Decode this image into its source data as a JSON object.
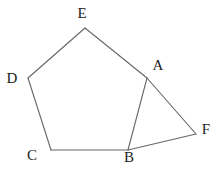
{
  "diagram": {
    "type": "geometry-figure",
    "stroke_color": "#666666",
    "points": {
      "A": {
        "x": 147,
        "y": 78,
        "label": "A",
        "lx": 158,
        "ly": 67
      },
      "B": {
        "x": 128,
        "y": 150,
        "label": "B",
        "lx": 129,
        "ly": 159
      },
      "C": {
        "x": 51,
        "y": 150,
        "label": "C",
        "lx": 32,
        "ly": 157
      },
      "D": {
        "x": 28,
        "y": 78,
        "label": "D",
        "lx": 12,
        "ly": 80
      },
      "E": {
        "x": 85,
        "y": 28,
        "label": "E",
        "lx": 82,
        "ly": 15
      },
      "F": {
        "x": 196,
        "y": 134,
        "label": "F",
        "lx": 206,
        "ly": 131
      }
    },
    "segments": [
      [
        "E",
        "D"
      ],
      [
        "D",
        "C"
      ],
      [
        "C",
        "B"
      ],
      [
        "B",
        "A"
      ],
      [
        "A",
        "E"
      ],
      [
        "A",
        "F"
      ],
      [
        "F",
        "B"
      ]
    ]
  }
}
